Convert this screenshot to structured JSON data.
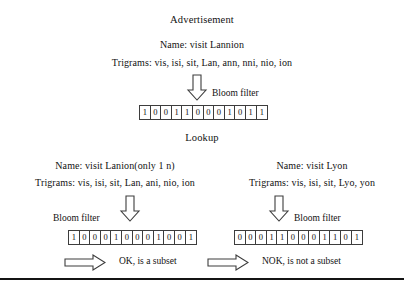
{
  "figure": {
    "advertisement": {
      "title": "Advertisement",
      "name_line": "Name: visit Lannion",
      "trigrams_line": "Trigrams: vis, isi, sit, Lan, ann, nni, nio, ion",
      "arrow_label": "Bloom filter",
      "bits": [
        "1",
        "0",
        "0",
        "1",
        "1",
        "0",
        "0",
        "0",
        "1",
        "0",
        "1",
        "1"
      ]
    },
    "lookup": {
      "title": "Lookup",
      "left": {
        "name_line": "Name: visit Lanion(only 1 n)",
        "trigrams_line": "Trigrams: vis, isi, sit, Lan, ani, nio, ion",
        "arrow_label": "Bloom filter",
        "bits": [
          "1",
          "0",
          "0",
          "0",
          "1",
          "0",
          "0",
          "0",
          "1",
          "0",
          "0",
          "1"
        ],
        "result": "OK, is a subset"
      },
      "right": {
        "name_line": "Name: visit Lyon",
        "trigrams_line": "Trigrams: vis, isi, sit, Lyo, yon",
        "arrow_label": "Bloom filter",
        "bits": [
          "0",
          "0",
          "0",
          "1",
          "1",
          "0",
          "0",
          "0",
          "1",
          "1",
          "0",
          "1"
        ],
        "result": "NOK, is not a subset"
      }
    }
  },
  "colors": {
    "ink": "#121212",
    "stroke": "#3d3d3d",
    "rule": "#141414",
    "background": "#ffffff"
  }
}
